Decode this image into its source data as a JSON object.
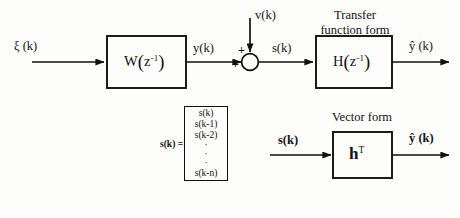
{
  "diagram": {
    "title_visible": false,
    "background_color": "#fdfdfc",
    "line_color": "#111111",
    "blocks": {
      "w_block": {
        "name": "W-filter-block",
        "text_main": "W",
        "text_arg": "z",
        "text_exp": "-1"
      },
      "h_block": {
        "name": "H-transfer-function-block",
        "text_main": "H",
        "text_arg": "z",
        "text_exp": "-1"
      },
      "ht_block": {
        "name": "h-transpose-vector-block",
        "text_main": "h",
        "text_exp": "T"
      }
    },
    "captions": {
      "transfer_form_line1": "Transfer",
      "transfer_form_line2": "function form",
      "vector_form": "Vector form"
    },
    "signals": {
      "input_noise": "ξ (k)",
      "w_output": "y(k)",
      "disturbance": "v(k)",
      "sum_output": "s(k)",
      "top_output": "ŷ (k)",
      "vector_input": "s(k)",
      "bottom_output": "ŷ (k)"
    },
    "summing_junction": {
      "name": "summing-junction",
      "sign_top": "+",
      "sign_left": "+"
    },
    "state_vector": {
      "lhs": "s(k) =",
      "elements": [
        "s(k)",
        "s(k-1)",
        "s(k-2)",
        "·",
        "·",
        "·",
        "s(k-n)"
      ]
    }
  }
}
